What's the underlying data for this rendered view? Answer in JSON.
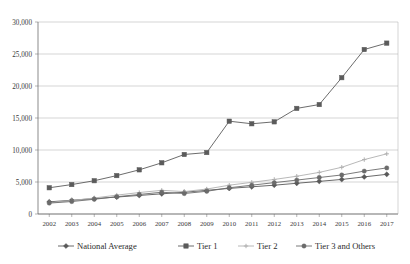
{
  "chart_data": {
    "type": "line",
    "title": "",
    "subtitle": "",
    "xlabel": "",
    "ylabel": "",
    "categories": [
      "2002",
      "2003",
      "2004",
      "2005",
      "2006",
      "2007",
      "2008",
      "2009",
      "2010",
      "2011",
      "2012",
      "2013",
      "2014",
      "2015",
      "2016",
      "2017"
    ],
    "ylim": [
      0,
      30000
    ],
    "ytick_labels": [
      "30,000",
      "25,000",
      "20,000",
      "15,000",
      "10,000",
      "5,000",
      "0"
    ],
    "ytick_values": [
      30000,
      25000,
      20000,
      15000,
      10000,
      5000,
      0
    ],
    "grid": true,
    "legend_position": "bottom",
    "series": [
      {
        "name": "National Average",
        "color": "#595959",
        "marker": "diamond",
        "values": [
          1900,
          2150,
          2400,
          2650,
          2900,
          3150,
          3400,
          3700,
          4000,
          4250,
          4500,
          4800,
          5100,
          5400,
          5800,
          6200
        ]
      },
      {
        "name": "Tier 1",
        "color": "#5b5b5b",
        "marker": "square",
        "values": [
          4100,
          4600,
          5200,
          6000,
          6900,
          8000,
          9300,
          9600,
          14500,
          14100,
          14400,
          16500,
          17100,
          21300,
          25700,
          26700
        ]
      },
      {
        "name": "Tier 2",
        "color": "#b0b0b0",
        "marker": "cross",
        "values": [
          1750,
          2100,
          2500,
          2950,
          3350,
          3700,
          3500,
          3900,
          4500,
          4950,
          5400,
          5900,
          6500,
          7300,
          8500,
          9400
        ]
      },
      {
        "name": "Tier 3 and Others",
        "color": "#6b6b6b",
        "marker": "circle",
        "values": [
          1700,
          1950,
          2300,
          2700,
          3050,
          3400,
          3200,
          3550,
          4100,
          4500,
          4900,
          5300,
          5700,
          6100,
          6700,
          7200
        ]
      }
    ]
  },
  "legend": {
    "items": [
      {
        "label": "National Average"
      },
      {
        "label": "Tier 1"
      },
      {
        "label": "Tier 2"
      },
      {
        "label": "Tier 3 and Others"
      }
    ]
  }
}
